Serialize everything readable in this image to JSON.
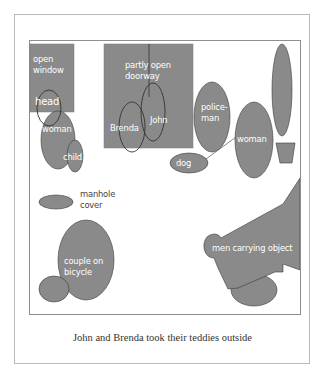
{
  "figure": {
    "caption": "John and Brenda took their teddies outside",
    "fill_color": "#8a8a8a",
    "outline_color": "#3a3a3a",
    "label_color": "#ffffff"
  },
  "regions": {
    "open_window": {
      "line1": "open",
      "line2": "window"
    },
    "head": {
      "label": "head"
    },
    "woman_left": {
      "label": "woman"
    },
    "child": {
      "label": "child"
    },
    "doorway": {
      "line1": "partly open",
      "line2": "doorway"
    },
    "brenda": {
      "label": "Brenda"
    },
    "john": {
      "label": "John"
    },
    "policeman": {
      "line1": "police-",
      "line2": "man"
    },
    "dog": {
      "label": "dog"
    },
    "woman_right": {
      "label": "woman"
    },
    "plant": {
      "label": ""
    },
    "manhole": {
      "line1": "manhole",
      "line2": "cover"
    },
    "couple": {
      "line1": "couple on",
      "line2": "bicycle"
    },
    "men_carrying": {
      "label": "men carrying object"
    }
  }
}
